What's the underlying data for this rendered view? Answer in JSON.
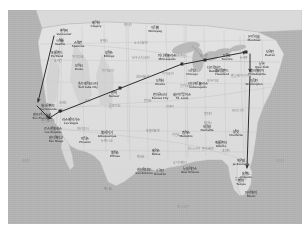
{
  "image": {
    "kind": "map-screenshot",
    "title": "United States travel route map",
    "width": 306,
    "height": 233,
    "background_color": "#ffffff",
    "ocean_color": "#b5b5b5",
    "land_color": "#e8e8e6",
    "route_color": "#1a1a1a",
    "margins": {
      "left": 8,
      "top": 10,
      "right": 4,
      "bottom": 9
    }
  },
  "map": {
    "region": "Continental United States",
    "style": "grayscale road atlas",
    "water_labels": [
      {
        "name": "태평양",
        "en": "Pacific Ocean",
        "x": 18,
        "y": 150
      },
      {
        "name": "멕시코만",
        "en": "Gulf of Mexico",
        "x": 175,
        "y": 196
      },
      {
        "name": "대서양",
        "en": "Atlantic Ocean",
        "x": 272,
        "y": 150
      }
    ],
    "cities": [
      {
        "name": "밴쿠버",
        "en": "Vancouver",
        "x": 56,
        "y": 20
      },
      {
        "name": "시애틀",
        "en": "Seattle",
        "x": 52,
        "y": 30
      },
      {
        "name": "스포캔",
        "en": "Spokane",
        "x": 70,
        "y": 32
      },
      {
        "name": "포틀랜드",
        "en": "Portland",
        "x": 49,
        "y": 42
      },
      {
        "name": "보이시",
        "en": "Boise",
        "x": 71,
        "y": 55
      },
      {
        "name": "빌링스",
        "en": "Billings",
        "x": 101,
        "y": 42
      },
      {
        "name": "캘거리",
        "en": "Calgary",
        "x": 88,
        "y": 12
      },
      {
        "name": "위니펙",
        "en": "Winnipeg",
        "x": 147,
        "y": 17
      },
      {
        "name": "미니애폴리스",
        "en": "Minneapolis",
        "x": 159,
        "y": 45
      },
      {
        "name": "솔트레이크시티",
        "en": "Salt Lake City",
        "x": 80,
        "y": 73
      },
      {
        "name": "덴버",
        "en": "Denver",
        "x": 106,
        "y": 82
      },
      {
        "name": "오마하",
        "en": "Omaha",
        "x": 152,
        "y": 70
      },
      {
        "name": "캔자스시티",
        "en": "Kansas City",
        "x": 152,
        "y": 84
      },
      {
        "name": "세인트루이스",
        "en": "St. Louis",
        "x": 174,
        "y": 84
      },
      {
        "name": "시카고",
        "en": "Chicago",
        "x": 184,
        "y": 60
      },
      {
        "name": "디트로이트",
        "en": "Detroit",
        "x": 206,
        "y": 57
      },
      {
        "name": "토론토",
        "en": "Toronto",
        "x": 219,
        "y": 45
      },
      {
        "name": "몬트리올",
        "en": "Montreal",
        "x": 246,
        "y": 26
      },
      {
        "name": "보스턴",
        "en": "Boston",
        "x": 262,
        "y": 41
      },
      {
        "name": "뉴욕",
        "en": "New York",
        "x": 254,
        "y": 53
      },
      {
        "name": "필라델피아",
        "en": "Philadelphia",
        "x": 249,
        "y": 60
      },
      {
        "name": "워싱턴",
        "en": "Washington",
        "x": 246,
        "y": 70
      },
      {
        "name": "인디애나폴리스",
        "en": "Indianapolis",
        "x": 190,
        "y": 73
      },
      {
        "name": "클리블랜드",
        "en": "Cleveland",
        "x": 214,
        "y": 60
      },
      {
        "name": "샌프란시스코",
        "en": "San Francisco",
        "x": 34,
        "y": 104
      },
      {
        "name": "새크라멘토",
        "en": "Sacramento",
        "x": 40,
        "y": 95
      },
      {
        "name": "로스앤젤레스",
        "en": "Los Angeles",
        "x": 45,
        "y": 118
      },
      {
        "name": "샌디에이고",
        "en": "San Diego",
        "x": 48,
        "y": 127
      },
      {
        "name": "라스베이거스",
        "en": "Las Vegas",
        "x": 63,
        "y": 109
      },
      {
        "name": "피닉스",
        "en": "Phoenix",
        "x": 77,
        "y": 128
      },
      {
        "name": "앨버커키",
        "en": "Albuquerque",
        "x": 99,
        "y": 122
      },
      {
        "name": "엘파소",
        "en": "El Paso",
        "x": 107,
        "y": 142
      },
      {
        "name": "댈러스",
        "en": "Dallas",
        "x": 148,
        "y": 140
      },
      {
        "name": "휴스턴",
        "en": "Houston",
        "x": 152,
        "y": 160
      },
      {
        "name": "샌안토니오",
        "en": "San Antonio",
        "x": 136,
        "y": 159
      },
      {
        "name": "뉴올리언스",
        "en": "New Orleans",
        "x": 182,
        "y": 158
      },
      {
        "name": "멤피스",
        "en": "Memphis",
        "x": 178,
        "y": 122
      },
      {
        "name": "내슈빌",
        "en": "Nashville",
        "x": 199,
        "y": 116
      },
      {
        "name": "애틀랜타",
        "en": "Atlanta",
        "x": 213,
        "y": 132
      },
      {
        "name": "샬럿",
        "en": "Charlotte",
        "x": 228,
        "y": 121
      },
      {
        "name": "잭슨빌",
        "en": "Jacksonville",
        "x": 233,
        "y": 150
      },
      {
        "name": "올랜도",
        "en": "Orlando",
        "x": 238,
        "y": 163
      },
      {
        "name": "탬파",
        "en": "Tampa",
        "x": 233,
        "y": 170
      },
      {
        "name": "마이애미",
        "en": "Miami",
        "x": 243,
        "y": 182
      }
    ],
    "states": [
      {
        "name": "몬태나",
        "x": 96,
        "y": 30
      },
      {
        "name": "와이오밍",
        "x": 100,
        "y": 60
      },
      {
        "name": "네바다",
        "x": 55,
        "y": 92
      },
      {
        "name": "유타",
        "x": 80,
        "y": 90
      },
      {
        "name": "콜로라도",
        "x": 107,
        "y": 95
      },
      {
        "name": "애리조나",
        "x": 75,
        "y": 118
      },
      {
        "name": "뉴멕시코",
        "x": 99,
        "y": 130
      },
      {
        "name": "텍사스",
        "x": 133,
        "y": 146
      },
      {
        "name": "캔자스",
        "x": 140,
        "y": 90
      },
      {
        "name": "아이오와",
        "x": 160,
        "y": 63
      },
      {
        "name": "일리노이",
        "x": 178,
        "y": 75
      },
      {
        "name": "오하이오",
        "x": 205,
        "y": 70
      },
      {
        "name": "캘리포니아",
        "x": 40,
        "y": 110
      },
      {
        "name": "오리건",
        "x": 50,
        "y": 50
      },
      {
        "name": "아이다호",
        "x": 70,
        "y": 46
      },
      {
        "name": "노스다코타",
        "x": 133,
        "y": 32
      },
      {
        "name": "사우스다코타",
        "x": 133,
        "y": 47
      },
      {
        "name": "네브래스카",
        "x": 135,
        "y": 66
      },
      {
        "name": "오클라호마",
        "x": 145,
        "y": 120
      },
      {
        "name": "아칸소",
        "x": 168,
        "y": 124
      },
      {
        "name": "미시시피",
        "x": 186,
        "y": 138
      },
      {
        "name": "앨라배마",
        "x": 200,
        "y": 138
      },
      {
        "name": "조지아",
        "x": 218,
        "y": 140
      },
      {
        "name": "플로리다",
        "x": 233,
        "y": 168
      },
      {
        "name": "버지니아",
        "x": 230,
        "y": 100
      },
      {
        "name": "펜실베이니아",
        "x": 232,
        "y": 65
      },
      {
        "name": "뉴욕주",
        "x": 236,
        "y": 47
      },
      {
        "name": "미시간",
        "x": 196,
        "y": 45
      },
      {
        "name": "위스콘신",
        "x": 172,
        "y": 45
      },
      {
        "name": "미주리",
        "x": 162,
        "y": 96
      },
      {
        "name": "켄터키",
        "x": 200,
        "y": 103
      },
      {
        "name": "테네시",
        "x": 200,
        "y": 112
      },
      {
        "name": "루이지애나",
        "x": 172,
        "y": 152
      },
      {
        "name": "캐나다",
        "x": 120,
        "y": 14
      },
      {
        "name": "멕시코",
        "x": 100,
        "y": 178
      }
    ]
  },
  "route": {
    "color": "#1a1a1a",
    "line_width": 1.1,
    "description": "Multi-leg travel route drawn with arrows across the United States",
    "legs": [
      {
        "id": "leg-1",
        "from": "Seattle",
        "to": "San Francisco",
        "x1": 54,
        "y1": 34,
        "x2": 38,
        "y2": 100,
        "arrow": "end"
      },
      {
        "id": "leg-2",
        "from": "San Francisco",
        "to": "Los Angeles",
        "x1": 37,
        "y1": 104,
        "x2": 49,
        "y2": 116,
        "arrow": "end"
      },
      {
        "id": "leg-3",
        "from": "Los Angeles",
        "to": "Las Vegas",
        "x1": 48,
        "y1": 117,
        "x2": 62,
        "y2": 108,
        "arrow": "start"
      },
      {
        "id": "leg-4",
        "from": "Las Vegas",
        "to": "Chicago",
        "x1": 60,
        "y1": 110,
        "x2": 182,
        "y2": 62,
        "arrow": "none"
      },
      {
        "id": "leg-5",
        "from": "Chicago",
        "to": "New York",
        "x1": 184,
        "y1": 62,
        "x2": 248,
        "y2": 50,
        "arrow": "end"
      },
      {
        "id": "leg-6",
        "from": "New York",
        "to": "Washington",
        "x1": 250,
        "y1": 52,
        "x2": 250,
        "y2": 70,
        "arrow": "end"
      },
      {
        "id": "leg-7",
        "from": "Washington",
        "to": "Tampa",
        "x1": 250,
        "y1": 74,
        "x2": 247,
        "y2": 168,
        "arrow": "end"
      }
    ],
    "stop_markers": [
      {
        "id": "stop-las-vegas",
        "x": 62,
        "y": 108,
        "shape": "square"
      },
      {
        "id": "stop-mid-plains",
        "x": 120,
        "y": 90,
        "shape": "square"
      },
      {
        "id": "stop-chicago",
        "x": 182,
        "y": 62,
        "shape": "square"
      },
      {
        "id": "stop-detroit",
        "x": 205,
        "y": 56,
        "shape": "square"
      },
      {
        "id": "stop-newyork",
        "x": 248,
        "y": 50,
        "shape": "square"
      }
    ]
  }
}
